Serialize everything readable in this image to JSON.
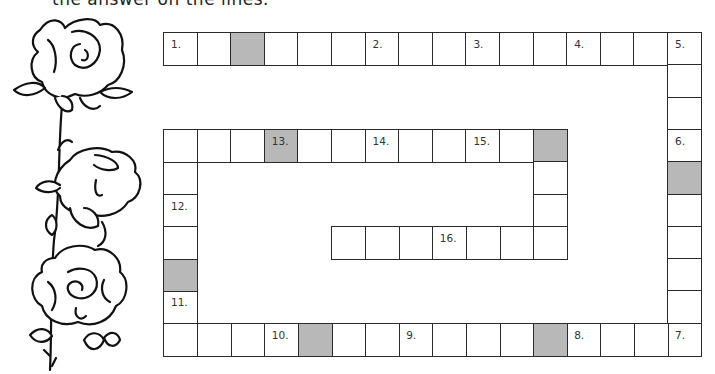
{
  "instructions_partial": "the answer on the lines.",
  "colors": {
    "border": "#2a2a2a",
    "shaded": "#b8b8b8",
    "blank": "#ffffff"
  },
  "grid": {
    "columns": 16,
    "rows": 10,
    "origin": {
      "x": 163,
      "y": 32
    },
    "cell_width": 33.6,
    "cell_height": 32.3,
    "cells": [
      {
        "r": 0,
        "c": 0,
        "label": "1."
      },
      {
        "r": 0,
        "c": 1
      },
      {
        "r": 0,
        "c": 2,
        "shaded": true
      },
      {
        "r": 0,
        "c": 3
      },
      {
        "r": 0,
        "c": 4
      },
      {
        "r": 0,
        "c": 5
      },
      {
        "r": 0,
        "c": 6,
        "label": "2."
      },
      {
        "r": 0,
        "c": 7
      },
      {
        "r": 0,
        "c": 8
      },
      {
        "r": 0,
        "c": 9,
        "label": "3."
      },
      {
        "r": 0,
        "c": 10
      },
      {
        "r": 0,
        "c": 11
      },
      {
        "r": 0,
        "c": 12,
        "label": "4."
      },
      {
        "r": 0,
        "c": 13
      },
      {
        "r": 0,
        "c": 14
      },
      {
        "r": 0,
        "c": 15,
        "label": "5."
      },
      {
        "r": 1,
        "c": 15
      },
      {
        "r": 2,
        "c": 15
      },
      {
        "r": 3,
        "c": 15,
        "label": "6."
      },
      {
        "r": 4,
        "c": 15,
        "shaded": true
      },
      {
        "r": 5,
        "c": 15
      },
      {
        "r": 6,
        "c": 15
      },
      {
        "r": 7,
        "c": 15
      },
      {
        "r": 8,
        "c": 15
      },
      {
        "r": 9,
        "c": 15,
        "label": "7."
      },
      {
        "r": 9,
        "c": 14
      },
      {
        "r": 9,
        "c": 13
      },
      {
        "r": 9,
        "c": 12,
        "label": "8."
      },
      {
        "r": 9,
        "c": 11,
        "shaded": true
      },
      {
        "r": 9,
        "c": 10
      },
      {
        "r": 9,
        "c": 9
      },
      {
        "r": 9,
        "c": 8
      },
      {
        "r": 9,
        "c": 7,
        "label": "9."
      },
      {
        "r": 9,
        "c": 6
      },
      {
        "r": 9,
        "c": 5
      },
      {
        "r": 9,
        "c": 4,
        "shaded": true
      },
      {
        "r": 9,
        "c": 3,
        "label": "10."
      },
      {
        "r": 9,
        "c": 2
      },
      {
        "r": 9,
        "c": 1
      },
      {
        "r": 9,
        "c": 0
      },
      {
        "r": 8,
        "c": 0,
        "label": "11."
      },
      {
        "r": 7,
        "c": 0,
        "shaded": true
      },
      {
        "r": 6,
        "c": 0
      },
      {
        "r": 5,
        "c": 0,
        "label": "12."
      },
      {
        "r": 4,
        "c": 0
      },
      {
        "r": 3,
        "c": 0
      },
      {
        "r": 3,
        "c": 1
      },
      {
        "r": 3,
        "c": 2
      },
      {
        "r": 3,
        "c": 3,
        "label": "13.",
        "shaded": true
      },
      {
        "r": 3,
        "c": 4
      },
      {
        "r": 3,
        "c": 5
      },
      {
        "r": 3,
        "c": 6,
        "label": "14."
      },
      {
        "r": 3,
        "c": 7
      },
      {
        "r": 3,
        "c": 8
      },
      {
        "r": 3,
        "c": 9,
        "label": "15."
      },
      {
        "r": 3,
        "c": 10
      },
      {
        "r": 3,
        "c": 11,
        "shaded": true
      },
      {
        "r": 4,
        "c": 11
      },
      {
        "r": 5,
        "c": 11
      },
      {
        "r": 6,
        "c": 11
      },
      {
        "r": 6,
        "c": 10
      },
      {
        "r": 6,
        "c": 9
      },
      {
        "r": 6,
        "c": 8,
        "label": "16."
      },
      {
        "r": 6,
        "c": 7
      },
      {
        "r": 6,
        "c": 6
      },
      {
        "r": 6,
        "c": 5
      }
    ]
  },
  "illustration": {
    "icon": "rose-vine-illustration",
    "description": "three roses on a vertical stem"
  }
}
